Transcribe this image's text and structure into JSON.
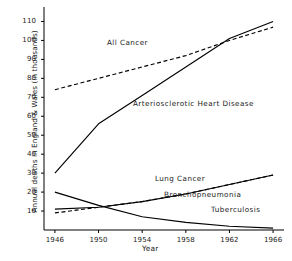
{
  "chart_data": {
    "type": "line",
    "title": "",
    "xlabel": "Year",
    "ylabel": "Annual deaths in England & Wales (in thousands)",
    "xlim": [
      1945,
      1967
    ],
    "ylim": [
      0,
      115
    ],
    "xticks": [
      1946,
      1950,
      1954,
      1958,
      1962,
      1966
    ],
    "xtick_labels": [
      "1946",
      "1950",
      "1954",
      "1958",
      "1962",
      "1966"
    ],
    "yticks": [
      10,
      20,
      30,
      40,
      50,
      60,
      70,
      80,
      90,
      100,
      110
    ],
    "ytick_labels": [
      "10",
      "20",
      "30",
      "40",
      "50",
      "60",
      "70",
      "80",
      "90",
      "100",
      "110"
    ],
    "grid": false,
    "legend": "inline-annotations",
    "series": [
      {
        "name": "All Cancer",
        "style": "dashed",
        "label_text": "All Cancer",
        "x": [
          1946,
          1950,
          1954,
          1958,
          1962,
          1966
        ],
        "values": [
          74,
          80,
          86,
          92,
          100,
          107
        ]
      },
      {
        "name": "Arteriosclerotic Heart Disease",
        "style": "solid",
        "label_text": "Arteriosclerotic Heart Disease",
        "x": [
          1946,
          1950,
          1954,
          1958,
          1962,
          1966
        ],
        "values": [
          30,
          56,
          71,
          86,
          101,
          110
        ]
      },
      {
        "name": "Lung Cancer",
        "style": "dashed",
        "label_text": "Lung Cancer",
        "x": [
          1946,
          1950,
          1954,
          1958,
          1962,
          1966
        ],
        "values": [
          9,
          12,
          15,
          19,
          24,
          29
        ]
      },
      {
        "name": "Bronchopneumonia",
        "style": "solid",
        "label_text": "Bronchopneumonia",
        "x": [
          1946,
          1950,
          1954,
          1958,
          1962,
          1966
        ],
        "values": [
          11,
          12,
          15,
          19,
          24,
          29
        ]
      },
      {
        "name": "Tuberculosis",
        "style": "solid",
        "label_text": "Tuberculosis",
        "x": [
          1946,
          1950,
          1954,
          1958,
          1962,
          1966
        ],
        "values": [
          20,
          13,
          7,
          4,
          2,
          1
        ]
      }
    ],
    "colors": {
      "line": "#000000",
      "axis": "#000000",
      "background": "#ffffff"
    }
  }
}
